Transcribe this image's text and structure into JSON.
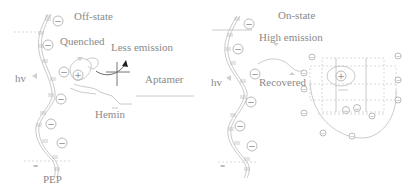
{
  "panels": {
    "left": {
      "state_label": "Off-state",
      "quench_label": "Quenched",
      "emission_label": "Less emission",
      "light_label": "hv",
      "aptamer_label": "Aptamer",
      "hemin_label": "Hemin",
      "polymer_label": "PEP",
      "neg_charge": "−",
      "pos_charge": "+",
      "equals_mark": "="
    },
    "right": {
      "state_label": "On-state",
      "emission_label": "High emission",
      "light_label": "hv",
      "recovered_label": "Recovered",
      "neg_charge": "−",
      "pos_charge": "+",
      "equals_mark": "="
    }
  },
  "colors": {
    "line": "#bdbdbd",
    "text": "#8a8a8a",
    "arrow": "#222222"
  }
}
